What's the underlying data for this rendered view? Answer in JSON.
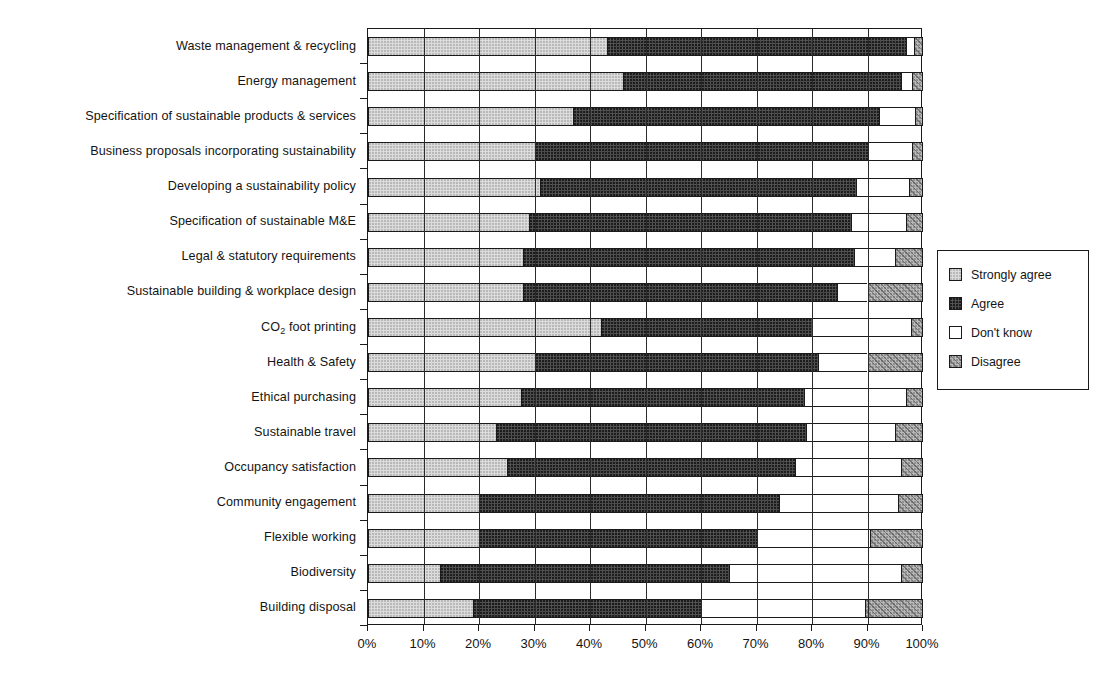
{
  "chart_data": {
    "type": "bar",
    "subtype": "stacked-horizontal-100-percent",
    "title": "",
    "xlabel": "",
    "ylabel": "",
    "xlim": [
      0,
      100
    ],
    "grid": true,
    "legend_position": "right",
    "x_tick_labels": [
      "0%",
      "10%",
      "20%",
      "30%",
      "40%",
      "50%",
      "60%",
      "70%",
      "80%",
      "90%",
      "100%"
    ],
    "x_ticks": [
      0,
      10,
      20,
      30,
      40,
      50,
      60,
      70,
      80,
      90,
      100
    ],
    "categories": [
      "Waste management & recycling",
      "Energy management",
      "Specification of sustainable products & services",
      "Business proposals incorporating sustainability",
      "Developing a sustainability policy",
      "Specification of sustainable M&E",
      "Legal & statutory requirements",
      "Sustainable building & workplace design",
      "CO2 foot printing",
      "Health & Safety",
      "Ethical purchasing",
      "Sustainable travel",
      "Occupancy satisfaction",
      "Community engagement",
      "Flexible working",
      "Biodiversity",
      "Building disposal"
    ],
    "series": [
      {
        "name": "Strongly agree",
        "color": "#dcdcdc",
        "values": [
          43,
          46,
          37,
          30,
          31,
          29,
          28,
          28,
          42,
          30,
          27.5,
          23,
          25,
          20,
          20,
          13,
          19
        ]
      },
      {
        "name": "Agree",
        "color": "#4a4a4a",
        "values": [
          54,
          50,
          55,
          60,
          57,
          58,
          59.5,
          56.5,
          38,
          51,
          51,
          56,
          52,
          54,
          50,
          52,
          41
        ]
      },
      {
        "name": "Don't know",
        "color": "#ffffff",
        "values": [
          1.4,
          2,
          6.6,
          8,
          9.5,
          10,
          7.5,
          5.5,
          17.8,
          9,
          18.5,
          16,
          19,
          21.5,
          20.5,
          31,
          29.5
        ]
      },
      {
        "name": "Disagree",
        "color": "#b9b9b9",
        "values": [
          1.6,
          2,
          1.4,
          2,
          2.5,
          3,
          5,
          10,
          2.2,
          10,
          3,
          5,
          4,
          4.5,
          9.5,
          4,
          10.5
        ]
      }
    ]
  },
  "legend": {
    "items": [
      {
        "label": "Strongly agree",
        "swatch": "fill-strongly"
      },
      {
        "label": "Agree",
        "swatch": "fill-agree"
      },
      {
        "label": "Don't know",
        "swatch": "fill-dontknow"
      },
      {
        "label": "Disagree",
        "swatch": "fill-disagree"
      }
    ]
  }
}
